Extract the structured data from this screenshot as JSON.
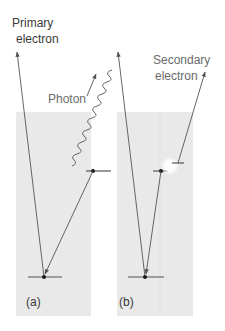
{
  "colors": {
    "panel": "#e9e9e9",
    "line": "#555555",
    "level": "#555555",
    "dot": "#1a1a1a",
    "text": "#3a3a3a",
    "text_light": "#6a6a6a"
  },
  "panel_a": {
    "label": "(a)",
    "primary_label_line1": "Primary",
    "primary_label_line2": "electron",
    "photon_label": "Photon"
  },
  "panel_b": {
    "label": "(b)",
    "secondary_label_line1": "Secondary",
    "secondary_label_line2": "electron"
  }
}
